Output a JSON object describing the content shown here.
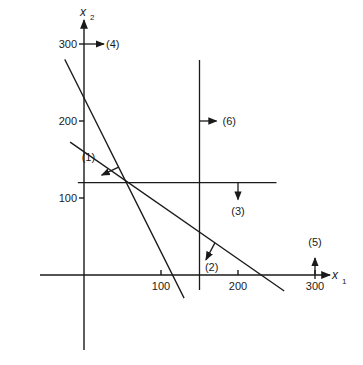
{
  "diagram": {
    "type": "linear-programming-feasible-region",
    "x_axis": {
      "name": "x",
      "subscript": "1",
      "ticks": [
        "100",
        "200",
        "300"
      ],
      "tick_values": [
        100,
        200,
        300
      ]
    },
    "y_axis": {
      "name": "x",
      "subscript": "2",
      "ticks": [
        "100",
        "200",
        "300"
      ],
      "tick_values": [
        100,
        200,
        300
      ]
    },
    "constraints": [
      {
        "id": "1",
        "label": "(1)",
        "kind": "line",
        "x_intercept": 115,
        "y_intercept": 230,
        "direction": "toward-origin"
      },
      {
        "id": "2",
        "label": "(2)",
        "kind": "line",
        "x_intercept": 230,
        "y_intercept": 160,
        "direction": "toward-origin"
      },
      {
        "id": "3",
        "label": "(3)",
        "kind": "horizontal",
        "value": 120,
        "direction": "down"
      },
      {
        "id": "4",
        "label": "(4)",
        "kind": "axis-x2",
        "value": 0,
        "direction": "right"
      },
      {
        "id": "5",
        "label": "(5)",
        "kind": "axis-x1",
        "value": 0,
        "direction": "up"
      },
      {
        "id": "6",
        "label": "(6)",
        "kind": "vertical",
        "value": 150,
        "direction": "right"
      }
    ]
  }
}
